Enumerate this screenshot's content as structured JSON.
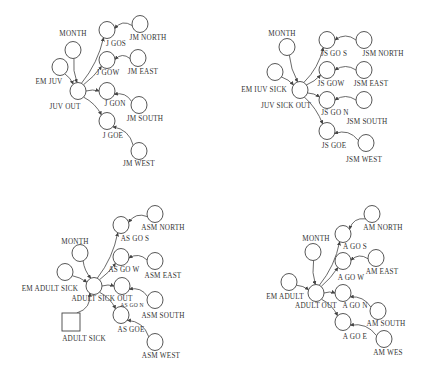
{
  "diagram": {
    "type": "stock-flow causal diagrams",
    "style": {
      "stroke": "#444444",
      "text": "#333333",
      "background": "#ffffff"
    },
    "panels": [
      {
        "id": "juvenile",
        "nodes": [
          {
            "id": "month",
            "label": "MONTH",
            "x": 73,
            "y": 50,
            "lx": 73,
            "ly": 36,
            "shape": "circle"
          },
          {
            "id": "em",
            "label": "EM  JUV",
            "x": 60,
            "y": 67,
            "lx": 49,
            "ly": 84,
            "shape": "circle"
          },
          {
            "id": "out",
            "label": "JUV  OUT",
            "x": 78,
            "y": 91,
            "lx": 65,
            "ly": 109,
            "shape": "circle"
          },
          {
            "id": "gos",
            "label": "J  GOS",
            "x": 107,
            "y": 30,
            "lx": 116,
            "ly": 46,
            "shape": "circle"
          },
          {
            "id": "gow",
            "label": "J  GOW",
            "x": 107,
            "y": 60,
            "lx": 108,
            "ly": 75,
            "shape": "circle"
          },
          {
            "id": "gon",
            "label": "J  GON",
            "x": 107,
            "y": 91,
            "lx": 115,
            "ly": 106,
            "shape": "circle"
          },
          {
            "id": "goe",
            "label": "J  GOE",
            "x": 107,
            "y": 121,
            "lx": 113,
            "ly": 138,
            "shape": "circle"
          },
          {
            "id": "north",
            "label": "JM  NORTH",
            "x": 140,
            "y": 24,
            "lx": 148,
            "ly": 40,
            "shape": "circle"
          },
          {
            "id": "east",
            "label": "JM  EAST",
            "x": 138,
            "y": 58,
            "lx": 143,
            "ly": 74,
            "shape": "circle"
          },
          {
            "id": "south",
            "label": "JM  SOUTH",
            "x": 139,
            "y": 105,
            "lx": 145,
            "ly": 121,
            "shape": "circle"
          },
          {
            "id": "west",
            "label": "JM  WEST",
            "x": 139,
            "y": 151,
            "lx": 139,
            "ly": 166,
            "shape": "circle"
          }
        ]
      },
      {
        "id": "juvenile-sick",
        "nodes": [
          {
            "id": "month",
            "label": "MONTH",
            "x": 287,
            "y": 47,
            "lx": 282,
            "ly": 36,
            "shape": "circle"
          },
          {
            "id": "em",
            "label": "EM  IUV  SICK",
            "x": 275,
            "y": 72,
            "lx": 264,
            "ly": 92,
            "shape": "circle"
          },
          {
            "id": "out",
            "label": "JUV  SICK  OUT",
            "x": 300,
            "y": 90,
            "lx": 286,
            "ly": 108,
            "shape": "circle"
          },
          {
            "id": "gos",
            "label": "JS  GO  S",
            "x": 327,
            "y": 40,
            "lx": 334,
            "ly": 56,
            "shape": "circle"
          },
          {
            "id": "gow",
            "label": "JS  GOW",
            "x": 327,
            "y": 70,
            "lx": 331,
            "ly": 86,
            "shape": "circle"
          },
          {
            "id": "gon",
            "label": "JS  GO  N",
            "x": 327,
            "y": 100,
            "lx": 335,
            "ly": 115,
            "shape": "circle"
          },
          {
            "id": "goe",
            "label": "JS  GOE",
            "x": 327,
            "y": 131,
            "lx": 334,
            "ly": 148,
            "shape": "circle"
          },
          {
            "id": "north",
            "label": "JSM  NORTH",
            "x": 364,
            "y": 40,
            "lx": 383,
            "ly": 56,
            "shape": "circle"
          },
          {
            "id": "east",
            "label": "JSM  EAST",
            "x": 364,
            "y": 70,
            "lx": 371,
            "ly": 86,
            "shape": "circle"
          },
          {
            "id": "south",
            "label": "JSM  SOUTH",
            "x": 364,
            "y": 100,
            "lx": 367,
            "ly": 124,
            "shape": "circle"
          },
          {
            "id": "west",
            "label": "JSM  WEST",
            "x": 366,
            "y": 143,
            "lx": 364,
            "ly": 162,
            "shape": "circle"
          }
        ]
      },
      {
        "id": "adult-sick",
        "nodes": [
          {
            "id": "month",
            "label": "MONTH",
            "x": 80,
            "y": 253,
            "lx": 75,
            "ly": 244,
            "shape": "circle"
          },
          {
            "id": "em",
            "label": "EM ADULT SICK",
            "x": 65,
            "y": 272,
            "lx": 50,
            "ly": 291,
            "shape": "circle"
          },
          {
            "id": "out",
            "label": "ADULT  SICK  OUT",
            "x": 94,
            "y": 286,
            "lx": 102,
            "ly": 301,
            "shape": "circle"
          },
          {
            "id": "gos",
            "label": "AS  GO  S",
            "x": 121,
            "y": 225,
            "lx": 135,
            "ly": 241,
            "shape": "circle"
          },
          {
            "id": "gow",
            "label": "AS  GO  W",
            "x": 121,
            "y": 257,
            "lx": 124,
            "ly": 272,
            "shape": "circle"
          },
          {
            "id": "gon",
            "label": "AS  GO  N",
            "x": 122,
            "y": 286,
            "lx": 132,
            "ly": 307,
            "shape": "circle",
            "small_label": true
          },
          {
            "id": "goe",
            "label": "AS  GOE",
            "x": 121,
            "y": 315,
            "lx": 131,
            "ly": 332,
            "shape": "circle"
          },
          {
            "id": "north",
            "label": "ASM  NORTH",
            "x": 155,
            "y": 214,
            "lx": 163,
            "ly": 230,
            "shape": "circle"
          },
          {
            "id": "east",
            "label": "ASM  EAST",
            "x": 155,
            "y": 261,
            "lx": 163,
            "ly": 278,
            "shape": "circle"
          },
          {
            "id": "south",
            "label": "ASM  SOUTH",
            "x": 155,
            "y": 300,
            "lx": 163,
            "ly": 318,
            "shape": "circle"
          },
          {
            "id": "west",
            "label": "ASM  WEST",
            "x": 155,
            "y": 342,
            "lx": 161,
            "ly": 358,
            "shape": "circle"
          },
          {
            "id": "stock",
            "label": "ADULT  SICK",
            "x": 71,
            "y": 322,
            "lx": 84,
            "ly": 341,
            "shape": "box"
          }
        ]
      },
      {
        "id": "adult",
        "nodes": [
          {
            "id": "month",
            "label": "MONTH",
            "x": 313,
            "y": 252,
            "lx": 316,
            "ly": 241,
            "shape": "circle"
          },
          {
            "id": "em",
            "label": "EM  ADULT",
            "x": 289,
            "y": 282,
            "lx": 285,
            "ly": 299,
            "shape": "circle"
          },
          {
            "id": "out",
            "label": "ADULT  OUT",
            "x": 316,
            "y": 293,
            "lx": 316,
            "ly": 308,
            "shape": "circle"
          },
          {
            "id": "gos",
            "label": "A  GO  S",
            "x": 343,
            "y": 234,
            "lx": 355,
            "ly": 249,
            "shape": "circle"
          },
          {
            "id": "gow",
            "label": "A  GO  W",
            "x": 343,
            "y": 261,
            "lx": 351,
            "ly": 280,
            "shape": "circle"
          },
          {
            "id": "gon",
            "label": "A  GO  N",
            "x": 343,
            "y": 293,
            "lx": 355,
            "ly": 308,
            "shape": "circle"
          },
          {
            "id": "goe",
            "label": "A  GO  E",
            "x": 343,
            "y": 322,
            "lx": 355,
            "ly": 339,
            "shape": "circle"
          },
          {
            "id": "north",
            "label": "AM  NORTH",
            "x": 372,
            "y": 214,
            "lx": 383,
            "ly": 230,
            "shape": "circle"
          },
          {
            "id": "east",
            "label": "AM  EAST",
            "x": 376,
            "y": 258,
            "lx": 382,
            "ly": 274,
            "shape": "circle"
          },
          {
            "id": "south",
            "label": "AM  SOUTH",
            "x": 378,
            "y": 311,
            "lx": 386,
            "ly": 326,
            "shape": "circle"
          },
          {
            "id": "west",
            "label": "AM  WES",
            "x": 384,
            "y": 339,
            "lx": 388,
            "ly": 355,
            "shape": "circle"
          }
        ]
      }
    ]
  }
}
